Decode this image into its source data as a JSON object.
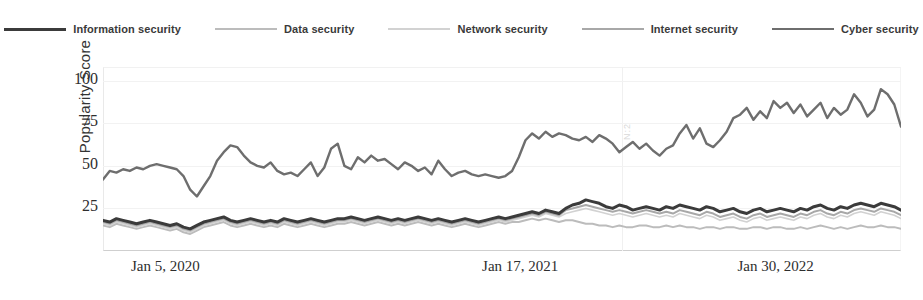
{
  "legend": {
    "position": "top-center",
    "items": [
      {
        "label": "Information security",
        "color": "#3b3b3b",
        "width": 3.0
      },
      {
        "label": "Data security",
        "color": "#bcbcbc",
        "width": 2.0
      },
      {
        "label": "Network security",
        "color": "#d2d2d2",
        "width": 1.6
      },
      {
        "label": "Internet security",
        "color": "#a8a8a8",
        "width": 2.0
      },
      {
        "label": "Cyber security",
        "color": "#6e6e6e",
        "width": 2.4
      }
    ]
  },
  "axes": {
    "ylabel": "Popularity Score",
    "yticks": [
      "25",
      "50",
      "75",
      "100"
    ],
    "ytick_values": [
      25,
      50,
      75,
      100
    ],
    "ylim": [
      0,
      108
    ],
    "xticks": [
      "Jan 5, 2020",
      "Jan 17, 2021",
      "Jan 30, 2022"
    ],
    "xtick_positions": [
      0.035,
      0.475,
      0.795
    ],
    "grid": "horizontal-faint"
  },
  "watermark": "N:2",
  "chart_data": {
    "type": "line",
    "title": "",
    "xlabel": "",
    "ylabel": "Popularity Score",
    "ylim": [
      0,
      108
    ],
    "grid": true,
    "legend_position": "top-center",
    "x_axis_kind": "weekly-date",
    "x_tick_labels": [
      "Jan 5, 2020",
      "Jan 17, 2021",
      "Jan 30, 2022"
    ],
    "n_points": 120,
    "series": [
      {
        "name": "Cyber security",
        "color": "#6e6e6e",
        "values": [
          42,
          47,
          46,
          48,
          47,
          49,
          48,
          50,
          51,
          50,
          49,
          48,
          44,
          36,
          32,
          38,
          44,
          53,
          58,
          62,
          61,
          56,
          52,
          50,
          49,
          52,
          47,
          45,
          46,
          44,
          48,
          52,
          44,
          49,
          60,
          63,
          50,
          48,
          55,
          52,
          56,
          53,
          54,
          51,
          48,
          52,
          50,
          47,
          49,
          45,
          53,
          48,
          44,
          46,
          47,
          45,
          44,
          45,
          44,
          43,
          44,
          47,
          55,
          65,
          69,
          66,
          70,
          67,
          69,
          68,
          66,
          65,
          67,
          64,
          68,
          66,
          63,
          58,
          61,
          64,
          60,
          63,
          59,
          56,
          60,
          62,
          69,
          74,
          66,
          72,
          63,
          61,
          65,
          70,
          78,
          80,
          84,
          77,
          82,
          78,
          88,
          84,
          87,
          81,
          86,
          79,
          83,
          87,
          78,
          84,
          80,
          83,
          92,
          87,
          79,
          83,
          95,
          92,
          86,
          73
        ]
      },
      {
        "name": "Information security",
        "color": "#3b3b3b",
        "values": [
          18,
          17,
          19,
          18,
          17,
          16,
          17,
          18,
          17,
          16,
          15,
          16,
          14,
          13,
          15,
          17,
          18,
          19,
          20,
          18,
          17,
          18,
          19,
          18,
          17,
          18,
          17,
          19,
          18,
          17,
          18,
          19,
          18,
          17,
          18,
          19,
          19,
          20,
          19,
          18,
          19,
          20,
          19,
          18,
          19,
          18,
          19,
          20,
          19,
          18,
          19,
          18,
          17,
          18,
          19,
          18,
          17,
          18,
          19,
          20,
          19,
          20,
          21,
          22,
          23,
          22,
          24,
          23,
          22,
          25,
          27,
          28,
          30,
          29,
          28,
          26,
          25,
          27,
          26,
          24,
          25,
          26,
          25,
          24,
          26,
          25,
          27,
          26,
          25,
          24,
          26,
          25,
          23,
          24,
          25,
          23,
          22,
          24,
          25,
          23,
          24,
          25,
          24,
          23,
          25,
          24,
          26,
          27,
          25,
          24,
          26,
          25,
          27,
          28,
          27,
          26,
          28,
          27,
          26,
          24
        ]
      },
      {
        "name": "Internet security",
        "color": "#a8a8a8",
        "values": [
          17,
          16,
          18,
          17,
          16,
          15,
          16,
          17,
          16,
          15,
          14,
          15,
          13,
          12,
          14,
          16,
          17,
          18,
          19,
          17,
          16,
          17,
          18,
          17,
          16,
          17,
          16,
          18,
          17,
          16,
          17,
          18,
          17,
          16,
          17,
          18,
          18,
          19,
          18,
          17,
          18,
          19,
          18,
          17,
          18,
          17,
          18,
          19,
          18,
          17,
          18,
          17,
          16,
          17,
          18,
          17,
          16,
          17,
          18,
          19,
          18,
          19,
          20,
          21,
          22,
          21,
          23,
          22,
          21,
          24,
          25,
          26,
          27,
          26,
          25,
          24,
          23,
          24,
          23,
          22,
          23,
          24,
          23,
          22,
          23,
          22,
          24,
          23,
          22,
          21,
          23,
          22,
          20,
          21,
          22,
          20,
          19,
          21,
          22,
          20,
          21,
          22,
          21,
          20,
          22,
          21,
          23,
          24,
          22,
          21,
          23,
          22,
          24,
          25,
          24,
          23,
          25,
          24,
          23,
          21
        ]
      },
      {
        "name": "Network security",
        "color": "#d2d2d2",
        "values": [
          16,
          15,
          17,
          16,
          15,
          14,
          15,
          16,
          15,
          14,
          13,
          14,
          12,
          11,
          13,
          15,
          16,
          17,
          18,
          16,
          15,
          16,
          17,
          16,
          15,
          16,
          15,
          17,
          16,
          15,
          16,
          17,
          16,
          15,
          16,
          17,
          17,
          18,
          17,
          16,
          17,
          18,
          17,
          16,
          17,
          16,
          17,
          18,
          17,
          16,
          17,
          16,
          15,
          16,
          17,
          16,
          15,
          16,
          17,
          18,
          17,
          18,
          19,
          20,
          21,
          20,
          22,
          21,
          20,
          22,
          23,
          24,
          25,
          24,
          23,
          22,
          21,
          22,
          21,
          20,
          21,
          22,
          21,
          20,
          21,
          20,
          22,
          21,
          20,
          19,
          21,
          20,
          18,
          19,
          20,
          18,
          17,
          19,
          20,
          18,
          19,
          20,
          19,
          18,
          20,
          19,
          21,
          22,
          20,
          19,
          21,
          20,
          22,
          23,
          22,
          21,
          23,
          22,
          21,
          19
        ]
      },
      {
        "name": "Data security",
        "color": "#bcbcbc",
        "values": [
          15,
          14,
          16,
          15,
          14,
          13,
          14,
          15,
          14,
          13,
          12,
          13,
          11,
          10,
          12,
          14,
          15,
          16,
          17,
          15,
          14,
          15,
          16,
          15,
          14,
          15,
          14,
          16,
          15,
          14,
          15,
          16,
          15,
          14,
          15,
          16,
          16,
          17,
          16,
          15,
          16,
          17,
          16,
          15,
          16,
          15,
          16,
          17,
          16,
          15,
          16,
          15,
          14,
          15,
          16,
          15,
          14,
          15,
          16,
          17,
          16,
          17,
          17,
          18,
          19,
          18,
          19,
          18,
          17,
          18,
          18,
          17,
          16,
          16,
          15,
          15,
          14,
          15,
          14,
          14,
          15,
          15,
          14,
          14,
          15,
          14,
          15,
          14,
          14,
          13,
          14,
          14,
          13,
          14,
          14,
          13,
          13,
          14,
          14,
          13,
          14,
          14,
          13,
          13,
          14,
          13,
          14,
          15,
          14,
          13,
          14,
          13,
          14,
          15,
          14,
          14,
          15,
          14,
          14,
          13
        ]
      }
    ]
  }
}
